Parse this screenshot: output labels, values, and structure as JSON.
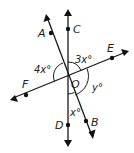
{
  "diagram": {
    "type": "intersecting-lines",
    "center_point": "O",
    "points": [
      {
        "name": "A",
        "label": "A"
      },
      {
        "name": "B",
        "label": "B"
      },
      {
        "name": "C",
        "label": "C"
      },
      {
        "name": "D",
        "label": "D"
      },
      {
        "name": "E",
        "label": "E"
      },
      {
        "name": "F",
        "label": "F"
      },
      {
        "name": "O",
        "label": "O"
      }
    ],
    "lines": [
      {
        "name": "line-CD",
        "through": [
          "C",
          "O",
          "D"
        ]
      },
      {
        "name": "line-AB",
        "through": [
          "A",
          "O",
          "B"
        ]
      },
      {
        "name": "line-FE",
        "through": [
          "F",
          "O",
          "E"
        ]
      }
    ],
    "angles": [
      {
        "name": "angle-AOF",
        "label": "4x°",
        "between": [
          "A",
          "F"
        ]
      },
      {
        "name": "angle-COE",
        "label": "3x°",
        "between": [
          "C",
          "E"
        ]
      },
      {
        "name": "angle-EOB",
        "label": "y°",
        "between": [
          "E",
          "B"
        ]
      },
      {
        "name": "angle-DOB",
        "label": "x°",
        "between": [
          "D",
          "B"
        ]
      }
    ]
  }
}
